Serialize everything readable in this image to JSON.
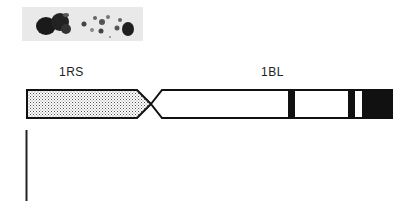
{
  "figure": {
    "photo": {
      "description": "chromosome micrograph",
      "background": "#e9e9e9"
    },
    "labels": {
      "left_arm": "1RS",
      "right_arm": "1BL"
    },
    "chromosome": {
      "left_arm_fill": "stippled",
      "bands": [
        {
          "name": "band-1",
          "x_start": 288,
          "x_end": 295
        },
        {
          "name": "band-2",
          "x_start": 348,
          "x_end": 355
        },
        {
          "name": "terminal-block",
          "x_start": 362,
          "x_end": 392
        }
      ]
    },
    "scale_bar": {
      "orientation": "vertical"
    }
  }
}
